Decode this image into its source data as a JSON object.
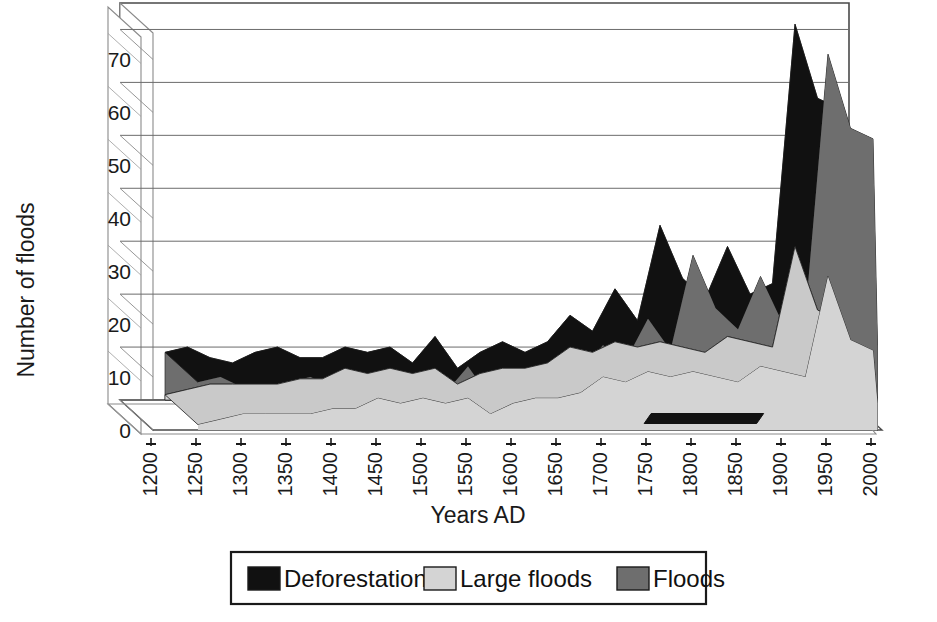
{
  "chart_data": {
    "type": "area",
    "title": "",
    "xlabel": "Years AD",
    "ylabel": "Number of floods",
    "xlim": [
      1200,
      2010
    ],
    "ylim": [
      0,
      75
    ],
    "yticks": [
      0,
      10,
      20,
      30,
      40,
      50,
      60,
      70
    ],
    "xticks": [
      1200,
      1250,
      1300,
      1350,
      1400,
      1450,
      1500,
      1550,
      1600,
      1650,
      1700,
      1750,
      1800,
      1850,
      1900,
      1950,
      2000
    ],
    "grid": true,
    "legend_position": "bottom",
    "style": "3d-stacked-area",
    "x": [
      1250,
      1275,
      1300,
      1325,
      1350,
      1375,
      1400,
      1425,
      1450,
      1475,
      1500,
      1525,
      1550,
      1575,
      1600,
      1625,
      1650,
      1675,
      1700,
      1725,
      1750,
      1775,
      1800,
      1825,
      1850,
      1875,
      1900,
      1925,
      1950,
      1975,
      2000,
      2005
    ],
    "series": [
      {
        "name": "Floods",
        "color": "#6e6e6e",
        "values": [
          9,
          10,
          8,
          7,
          9,
          10,
          8,
          8,
          10,
          9,
          10,
          7,
          12,
          6,
          9,
          11,
          9,
          11,
          16,
          13,
          21,
          15,
          33,
          23,
          19,
          29,
          20,
          22,
          71,
          57,
          55,
          16
        ]
      },
      {
        "name": "Large floods",
        "color": "#d4d4d4",
        "values": [
          1,
          2,
          3,
          3,
          3,
          3,
          4,
          4,
          6,
          5,
          6,
          5,
          6,
          3,
          5,
          6,
          6,
          7,
          10,
          9,
          11,
          10,
          11,
          10,
          9,
          12,
          11,
          10,
          29,
          17,
          15,
          5
        ]
      }
    ],
    "deforestation": {
      "name": "Deforestation",
      "color": "#111111",
      "start": 1770,
      "end": 1895,
      "note": "black bar along the floor of the plot"
    }
  },
  "legend": {
    "items": [
      {
        "label": "Deforestation",
        "color": "#111111"
      },
      {
        "label": "Large floods",
        "color": "#d4d4d4"
      },
      {
        "label": "Floods",
        "color": "#6e6e6e"
      }
    ]
  },
  "axes": {
    "y_title": "Number of floods",
    "x_title": "Years AD",
    "y_labels": [
      "70",
      "60",
      "50",
      "40",
      "30",
      "20",
      "10",
      "0"
    ],
    "x_labels": [
      "1200",
      "1250",
      "1300",
      "1350",
      "1400",
      "1450",
      "1500",
      "1550",
      "1600",
      "1650",
      "1700",
      "1750",
      "1800",
      "1850",
      "1900",
      "1950",
      "2000"
    ]
  },
  "colors": {
    "floods": "#6e6e6e",
    "large_floods": "#d4d4d4",
    "deforestation": "#111111",
    "grid": "#6b6b6b",
    "frame": "#4a4a4a",
    "background": "#ffffff"
  }
}
